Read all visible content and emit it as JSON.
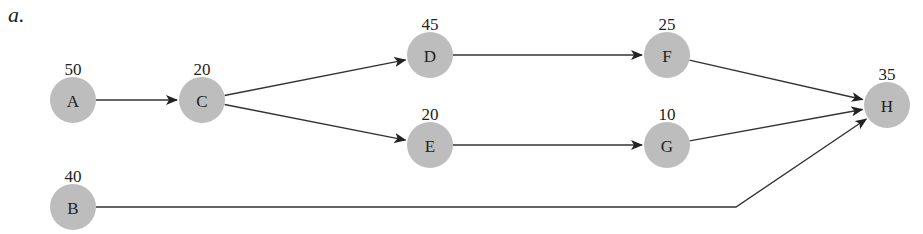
{
  "figure_label": "a.",
  "node_color": "#bdbdbd",
  "edge_color": "#333333",
  "nodes": [
    {
      "id": "A",
      "label": "A",
      "duration": "50",
      "x": 73,
      "y": 100
    },
    {
      "id": "B",
      "label": "B",
      "duration": "40",
      "x": 73,
      "y": 207
    },
    {
      "id": "C",
      "label": "C",
      "duration": "20",
      "x": 202,
      "y": 100
    },
    {
      "id": "D",
      "label": "D",
      "duration": "45",
      "x": 430,
      "y": 55
    },
    {
      "id": "E",
      "label": "E",
      "duration": "20",
      "x": 430,
      "y": 145
    },
    {
      "id": "F",
      "label": "F",
      "duration": "25",
      "x": 667,
      "y": 55
    },
    {
      "id": "G",
      "label": "G",
      "duration": "10",
      "x": 667,
      "y": 145
    },
    {
      "id": "H",
      "label": "H",
      "duration": "35",
      "x": 887,
      "y": 105
    }
  ],
  "edges": [
    {
      "from": "A",
      "to": "C"
    },
    {
      "from": "C",
      "to": "D"
    },
    {
      "from": "C",
      "to": "E"
    },
    {
      "from": "D",
      "to": "F"
    },
    {
      "from": "E",
      "to": "G"
    },
    {
      "from": "F",
      "to": "H"
    },
    {
      "from": "G",
      "to": "H"
    },
    {
      "from": "B",
      "to": "H",
      "via": [
        [
          736,
          207
        ]
      ]
    }
  ]
}
